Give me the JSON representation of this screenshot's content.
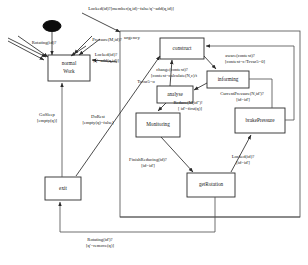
{
  "diagram": {
    "kind": "statechart",
    "title": "",
    "initial_pseudostate": "initial-state-dot",
    "region": {
      "name": "urgency",
      "label": "urgency"
    },
    "states": [
      {
        "id": "normalWork",
        "label_line1": "normal",
        "label_line2": "Work",
        "x": 48,
        "y": 55,
        "w": 42,
        "h": 26
      },
      {
        "id": "exit",
        "label_line1": "exit",
        "label_line2": "",
        "x": 45,
        "y": 177,
        "w": 36,
        "h": 23
      },
      {
        "id": "construct",
        "label_line1": "construct",
        "label_line2": "",
        "x": 160,
        "y": 38,
        "w": 44,
        "h": 21
      },
      {
        "id": "informing",
        "label_line1": "informing",
        "label_line2": "",
        "x": 207,
        "y": 71,
        "w": 42,
        "h": 17
      },
      {
        "id": "analyse",
        "label_line1": "analyse",
        "label_line2": "",
        "x": 157,
        "y": 86,
        "w": 36,
        "h": 17
      },
      {
        "id": "Monitoring",
        "label_line1": "Monitoring",
        "label_line2": "",
        "x": 136,
        "y": 113,
        "w": 44,
        "h": 24
      },
      {
        "id": "brakePressure",
        "label_line1": "brakePressure",
        "label_line2": "",
        "x": 235,
        "y": 108,
        "w": 50,
        "h": 25
      },
      {
        "id": "getRotation",
        "label_line1": "getRotation",
        "label_line2": "",
        "x": 187,
        "y": 173,
        "w": 48,
        "h": 24
      }
    ],
    "transitions": [
      {
        "id": "t-locked-to-region",
        "from": "normalWork",
        "to": "urgency",
        "label_line1": "Locked(id)?[member(q,id)=false/q'=add(q,id)]",
        "label_line2": ""
      },
      {
        "id": "t-rotating",
        "from": "region",
        "to": "normalWork",
        "label_line1": "Rotating(id)?",
        "label_line2": ""
      },
      {
        "id": "t-pressure",
        "from": "region",
        "to": "normalWork",
        "label_line1": "Pressure(M,id)?",
        "label_line2": ""
      },
      {
        "id": "t-locked-add",
        "from": "region",
        "to": "normalWork",
        "label_line1": "Locked(id)?",
        "label_line2": "[q'=add(q,id)]"
      },
      {
        "id": "t-gosleep",
        "from": "exit",
        "to": "normalWork",
        "label_line1": "GoSleep",
        "label_line2": "[empty(q)]"
      },
      {
        "id": "t-dorest",
        "from": "exit",
        "to": "construct",
        "label_line1": "DoRest",
        "label_line2": "[empty(q)=false]"
      },
      {
        "id": "t-aware",
        "from": "construct",
        "to": "informing",
        "label_line1": "aware(context)?",
        "label_line2": "[context=c/Tcvar5=0]"
      },
      {
        "id": "t-change",
        "from": "informing",
        "to": "analyse",
        "label_line1": "change(context)?",
        "label_line2": "[context=calculate(N,c)/t"
      },
      {
        "id": "t-tcvar",
        "from": "analyse",
        "to": "construct",
        "label_line1": "Tcvar5=o",
        "label_line2": ""
      },
      {
        "id": "t-reduce",
        "from": "analyse",
        "to": "Monitoring",
        "label_line1": "Reduce(M,id\")!",
        "label_line2": "[ id'=first(q)]"
      },
      {
        "id": "t-currentpressure",
        "from": "informing",
        "to": "brakePressure",
        "label_line1": "CurrentPressure(N,id')?",
        "label_line2": "[id=id']"
      },
      {
        "id": "t-finishreducing",
        "from": "Monitoring",
        "to": "getRotation",
        "label_line1": "FinishReducing(id)?",
        "label_line2": "[id=id']"
      },
      {
        "id": "t-locked-getrotation",
        "from": "getRotation",
        "to": "brakePressure",
        "label_line1": "Locked(id)?",
        "label_line2": "[id=id']"
      },
      {
        "id": "t-rotating-exit",
        "from": "getRotation",
        "to": "exit",
        "label_line1": "Rotating(id')?",
        "label_line2": "[q'=remove(q)]"
      }
    ]
  }
}
